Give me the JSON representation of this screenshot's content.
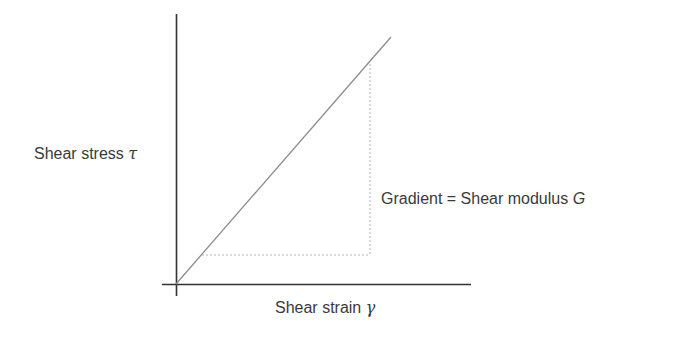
{
  "diagram": {
    "type": "stress-strain linear relationship",
    "y_axis_label": "Shear stress",
    "y_axis_symbol": "τ",
    "x_axis_label": "Shear strain",
    "x_axis_symbol": "γ",
    "annotation_text": "Gradient = Shear modulus",
    "annotation_symbol": "G",
    "colors": {
      "axis": "#333333",
      "line": "#8c8c8c",
      "dotted": "#b5b5b5",
      "text": "#3a3a3a"
    }
  }
}
